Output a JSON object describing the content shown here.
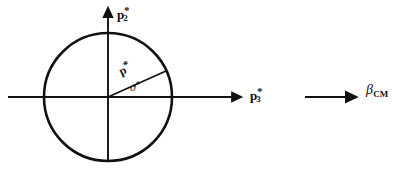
{
  "figure": {
    "type": "physics-momentum-diagram",
    "background_color": "#ffffff",
    "stroke_color": "#111111",
    "width": 405,
    "height": 171
  },
  "labels": {
    "vertical_axis": {
      "symbol": "p",
      "subscript": "2",
      "superscript": "*"
    },
    "horizontal_axis": {
      "symbol": "p",
      "subscript": "3",
      "superscript": "*"
    },
    "momentum_vector": {
      "symbol": "p",
      "superscript": "*"
    },
    "angle": {
      "symbol": "ϑ",
      "superscript": "*"
    },
    "boost_arrow": {
      "symbol": "β",
      "subscript": "CM"
    }
  },
  "geometry": {
    "origin": {
      "x": 108,
      "y": 97
    },
    "circle_radius": 64,
    "vertical_axis": {
      "x": 108,
      "y_top": 4,
      "y_bottom": 161
    },
    "horizontal_axis": {
      "y": 97,
      "x_left": 8,
      "x_right": 245
    },
    "momentum_vector": {
      "x1": 108,
      "y1": 97,
      "x2": 166,
      "y2": 71,
      "angle_degrees": 24
    },
    "boost_arrow": {
      "x1": 305,
      "y1": 97,
      "x2": 360,
      "y2": 97
    }
  }
}
